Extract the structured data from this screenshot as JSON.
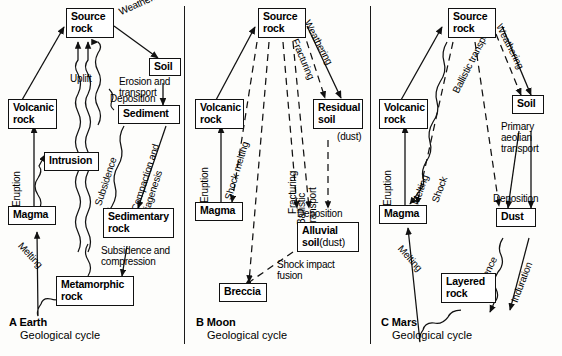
{
  "panels": [
    {
      "id": "a",
      "caption_letter": "A Earth",
      "caption_sub": "Geological cycle",
      "nodes": [
        {
          "name": "source-rock",
          "text": "Source\nrock"
        },
        {
          "name": "soil",
          "text": "Soil"
        },
        {
          "name": "volcanic-rock",
          "text": "Volcanic\nrock"
        },
        {
          "name": "sediment",
          "text": "Sediment"
        },
        {
          "name": "intrusion",
          "text": "Intrusion"
        },
        {
          "name": "magma",
          "text": "Magma"
        },
        {
          "name": "sedimentary-rock",
          "text": "Sedimentary\nrock"
        },
        {
          "name": "metamorphic-rock",
          "text": "Metamorphic\nrock"
        }
      ],
      "labels": [
        {
          "name": "weathering",
          "text": "Weathering"
        },
        {
          "name": "erosion-and-transport",
          "text": "Erosion and\ntransport"
        },
        {
          "name": "deposition",
          "text": "Deposition"
        },
        {
          "name": "uplift",
          "text": "Uplift"
        },
        {
          "name": "eruption",
          "text": "Eruption"
        },
        {
          "name": "subsidence",
          "text": "Subsidence"
        },
        {
          "name": "compaction-and-diagenesis",
          "text": "Compaction and\ndiagenesis"
        },
        {
          "name": "melting",
          "text": "Melting"
        },
        {
          "name": "subsidence-and-compression",
          "text": "Subsidence and\ncompression"
        }
      ]
    },
    {
      "id": "b",
      "caption_letter": "B Moon",
      "caption_sub": "Geological cycle",
      "nodes": [
        {
          "name": "source-rock",
          "text": "Source\nrock"
        },
        {
          "name": "volcanic-rock",
          "text": "Volcanic\nrock"
        },
        {
          "name": "residual-soil",
          "text": "Residual\nsoil"
        },
        {
          "name": "magma",
          "text": "Magma"
        },
        {
          "name": "alluvial-soil",
          "text": "Alluvial\nsoil (dust)"
        },
        {
          "name": "breccia",
          "text": "Breccia"
        }
      ],
      "labels": [
        {
          "name": "weathering",
          "text": "Weathering"
        },
        {
          "name": "fracturing-upper",
          "text": "Fracturing"
        },
        {
          "name": "dust",
          "text": "(dust)"
        },
        {
          "name": "eruption",
          "text": "Eruption"
        },
        {
          "name": "shock-melting",
          "text": "Shock melting"
        },
        {
          "name": "fracturing-lower",
          "text": "Fracturing"
        },
        {
          "name": "ballistic-transport",
          "text": "Ballistic\ntransport"
        },
        {
          "name": "deposition",
          "text": "Deposition"
        },
        {
          "name": "shock-impact-fusion",
          "text": "Shock impact\nfusion"
        }
      ]
    },
    {
      "id": "c",
      "caption_letter": "C Mars",
      "caption_sub": "Geological cycle",
      "nodes": [
        {
          "name": "source-rock",
          "text": "Source\nrock"
        },
        {
          "name": "volcanic-rock",
          "text": "Volcanic\nrock"
        },
        {
          "name": "soil",
          "text": "Soil"
        },
        {
          "name": "magma",
          "text": "Magma"
        },
        {
          "name": "dust",
          "text": "Dust"
        },
        {
          "name": "layered-rock",
          "text": "Layered\nrock"
        }
      ],
      "labels": [
        {
          "name": "weathering",
          "text": "Weathering"
        },
        {
          "name": "ballistic-transport",
          "text": "Ballistic transport"
        },
        {
          "name": "primary-aeolian-transport",
          "text": "Primary\naeolian\ntransport"
        },
        {
          "name": "deposition",
          "text": "Deposition"
        },
        {
          "name": "eruption",
          "text": "Eruption"
        },
        {
          "name": "melting-upper",
          "text": "Melting"
        },
        {
          "name": "shock",
          "text": "Shock"
        },
        {
          "name": "melting-lower",
          "text": "Melting"
        },
        {
          "name": "subsidence",
          "text": "Subsidence"
        },
        {
          "name": "induration",
          "text": "Induration"
        }
      ]
    }
  ],
  "text": {
    "source_rock": "Source rock",
    "soil": "Soil",
    "volcanic_rock": "Volcanic rock",
    "sediment": "Sediment",
    "intrusion": "Intrusion",
    "magma": "Magma",
    "sedimentary_rock": "Sedimentary rock",
    "metamorphic_rock": "Metamorphic rock",
    "residual_soil": "Residual soil",
    "alluvial_soil": "Alluvial soil (dust)",
    "breccia": "Breccia",
    "dust_node": "Dust",
    "layered_rock": "Layered rock"
  },
  "a": {
    "n_source_l1": "Source",
    "n_source_l2": "rock",
    "n_soil": "Soil",
    "n_volcanic_l1": "Volcanic",
    "n_volcanic_l2": "rock",
    "n_sediment": "Sediment",
    "n_intrusion": "Intrusion",
    "n_magma": "Magma",
    "n_sedrock_l1": "Sedimentary",
    "n_sedrock_l2": "rock",
    "n_metarock_l1": "Metamorphic",
    "n_metarock_l2": "rock",
    "l_weathering": "Weathering",
    "l_erosion1": "Erosion and",
    "l_erosion2": "transport",
    "l_deposition": "Deposition",
    "l_uplift": "Uplift",
    "l_eruption": "Eruption",
    "l_subsidence": "Subsidence",
    "l_compaction1": "Compaction and",
    "l_compaction2": "diagenesis",
    "l_melting": "Melting",
    "l_subcomp1": "Subsidence and",
    "l_subcomp2": "compression",
    "cap_title": "A Earth",
    "cap_sub": "Geological cycle"
  },
  "b": {
    "n_source_l1": "Source",
    "n_source_l2": "rock",
    "n_volcanic_l1": "Volcanic",
    "n_volcanic_l2": "rock",
    "n_residual_l1": "Residual",
    "n_residual_l2": "soil",
    "n_magma": "Magma",
    "n_alluvial_l1": "Alluvial",
    "n_alluvial_l2a": "soil",
    "n_alluvial_l2b": "(dust)",
    "n_breccia": "Breccia",
    "l_weathering": "Weathering",
    "l_fracturing_top": "Fracturing",
    "l_dust": "(dust)",
    "l_eruption": "Eruption",
    "l_shock_melting": "Shock melting",
    "l_fracturing_bot": "Fracturing",
    "l_ballistic1": "Ballistic",
    "l_ballistic2": "transport",
    "l_deposition": "Deposition",
    "l_shockimpact1": "Shock impact",
    "l_shockimpact2": "fusion",
    "cap_title": "B Moon",
    "cap_sub": "Geological cycle"
  },
  "c": {
    "n_source_l1": "Source",
    "n_source_l2": "rock",
    "n_volcanic_l1": "Volcanic",
    "n_volcanic_l2": "rock",
    "n_soil": "Soil",
    "n_magma": "Magma",
    "n_dust": "Dust",
    "n_layered_l1": "Layered",
    "n_layered_l2": "rock",
    "l_weathering": "Weathering",
    "l_ballistic": "Ballistic transport",
    "l_primary1": "Primary",
    "l_primary2": "aeolian",
    "l_primary3": "transport",
    "l_deposition": "Deposition",
    "l_eruption": "Eruption",
    "l_melting_up": "Melting",
    "l_shock": "Shock",
    "l_melting_low": "Melting",
    "l_subsidence": "Subsidence",
    "l_induration": "Induration",
    "cap_title": "C Mars",
    "cap_sub": "Geological cycle"
  }
}
